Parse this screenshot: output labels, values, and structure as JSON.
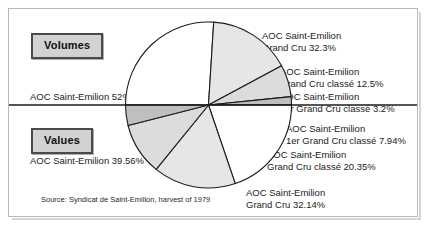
{
  "figure": {
    "source_note": "Source: Syndicat de Saint-Emilion, harvest of 1979",
    "badge_volumes": "Volumes",
    "badge_values": "Values"
  },
  "labels": {
    "volumes_aoc": "AOC Saint-Emilion 52%",
    "volumes_gc_line1": "AOC Saint-Emilion",
    "volumes_gc_line2": "Grand Cru 32.3%",
    "volumes_gcc_line1": "AOC Saint-Emilion",
    "volumes_gcc_line2": "Grand Cru classé 12.5%",
    "volumes_1gcc_line1": "AOC Saint-Emilion",
    "volumes_1gcc_line2": "1er Grand Cru classé 3.2%",
    "values_aoc": "AOC Saint-Emilion 39.56%",
    "values_1gcc_line1": "AOC Saint-Emilion",
    "values_1gcc_line2": "1er Grand Cru classé 7.94%",
    "values_gcc_line1": "AOC Saint-Emilion",
    "values_gcc_line2": "Grand Cru classé 20.35%",
    "values_gc_line1": "AOC Saint-Emilion",
    "values_gc_line2": "Grand Cru 32.14%"
  },
  "colors": {
    "slice_white": "#ffffff",
    "slice_light": "#e6e6e6",
    "slice_mid": "#dcdcdc",
    "slice_dark": "#bfbfbf",
    "outline": "#1b1b1b",
    "badge_fill": "#d2d2d2",
    "badge_border": "#4a4a4a",
    "frame_border": "#b9b9b9",
    "page_background": "#ffffff"
  },
  "chart_data": {
    "type": "pie",
    "title": "",
    "subtitle": "",
    "xlabel": "",
    "ylabel": "",
    "legend_position": "callout-labels",
    "grid": false,
    "note": "Double half-pie: upper semicircle = Volumes, lower semicircle = Values; each half sums to 100%.",
    "halves": [
      {
        "name": "Volumes",
        "orientation": "upper-semicircle",
        "categories": [
          "AOC Saint-Emilion",
          "AOC Saint-Emilion Grand Cru",
          "AOC Saint-Emilion Grand Cru classé",
          "AOC Saint-Emilion 1er Grand Cru classé"
        ],
        "values": [
          52,
          32.3,
          12.5,
          3.2
        ],
        "units": "%"
      },
      {
        "name": "Values",
        "orientation": "lower-semicircle",
        "categories": [
          "AOC Saint-Emilion",
          "AOC Saint-Emilion Grand Cru",
          "AOC Saint-Emilion Grand Cru classé",
          "AOC Saint-Emilion 1er Grand Cru classé"
        ],
        "values": [
          39.56,
          32.14,
          20.35,
          7.94
        ],
        "units": "%"
      }
    ]
  }
}
